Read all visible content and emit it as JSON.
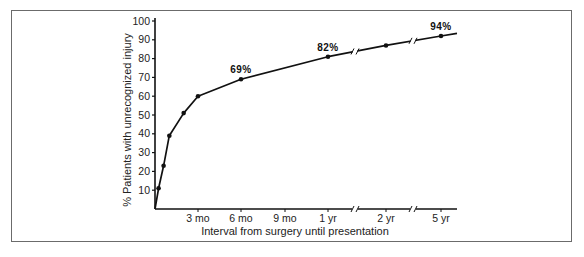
{
  "chart_data": {
    "type": "line",
    "title": "",
    "xlabel": "Interval from surgery until presentation",
    "ylabel": "% Patients with unrecognized injury",
    "ylim": [
      0,
      100
    ],
    "y_ticks": [
      10,
      20,
      30,
      40,
      50,
      60,
      70,
      80,
      90,
      100
    ],
    "x_ticks": [
      {
        "label": "3 mo",
        "months": 3
      },
      {
        "label": "6 mo",
        "months": 6
      },
      {
        "label": "9 mo",
        "months": 9
      },
      {
        "label": "1 yr",
        "months": 12
      },
      {
        "label": "2 yr",
        "months": 24
      },
      {
        "label": "5 yr",
        "months": 60
      }
    ],
    "axis_breaks": [
      "between 1 yr and 2 yr",
      "between 2 yr and 5 yr"
    ],
    "grid": false,
    "legend": "none",
    "series": [
      {
        "name": "Cumulative % patients with unrecognized injury",
        "points": [
          {
            "months": 0,
            "value": 0
          },
          {
            "months": 0.25,
            "value": 11
          },
          {
            "months": 0.6,
            "value": 23
          },
          {
            "months": 1,
            "value": 39
          },
          {
            "months": 2,
            "value": 51
          },
          {
            "months": 3,
            "value": 60
          },
          {
            "months": 6,
            "value": 69
          },
          {
            "months": 12,
            "value": 81
          },
          {
            "months": 24,
            "value": 87
          },
          {
            "months": 60,
            "value": 92
          }
        ]
      }
    ],
    "annotations": [
      {
        "text": "69%",
        "months": 6,
        "value": 69
      },
      {
        "text": "82%",
        "months": 12,
        "value": 81
      },
      {
        "text": "94%",
        "months": 60,
        "value": 92
      }
    ]
  }
}
